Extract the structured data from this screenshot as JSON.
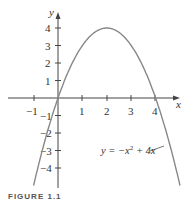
{
  "chart_data": {
    "type": "line",
    "title": "",
    "xlabel": "x",
    "ylabel": "y",
    "xlim": [
      -1.9,
      4.9
    ],
    "ylim": [
      -5,
      4.5
    ],
    "x_ticks": [
      -1,
      1,
      2,
      3,
      4
    ],
    "y_ticks": [
      -4,
      -3,
      -2,
      -1,
      1,
      2,
      3,
      4
    ],
    "grid": false,
    "series": [
      {
        "name": "y = -x^2 + 4x",
        "x": [
          -1,
          -0.5,
          0,
          0.5,
          1,
          1.5,
          2,
          2.5,
          3,
          3.5,
          4,
          4.5,
          5
        ],
        "values": [
          -5,
          -2.25,
          0,
          1.75,
          3,
          3.75,
          4,
          3.75,
          3,
          1.75,
          0,
          -2.25,
          -5
        ]
      }
    ],
    "annotations": [
      {
        "text": "y = −x² + 4x",
        "points_to_x": 4.3
      }
    ]
  },
  "labels": {
    "x_axis": "x",
    "y_axis": "y",
    "x_ticks": [
      "−1",
      "1",
      "2",
      "3",
      "4"
    ],
    "y_ticks": [
      "4",
      "3",
      "2",
      "1",
      "−1",
      "−2",
      "−3",
      "−4"
    ],
    "equation_prefix": "y = −x",
    "equation_sup": "2",
    "equation_suffix": " + 4x",
    "caption": "FIGURE 1.1"
  }
}
